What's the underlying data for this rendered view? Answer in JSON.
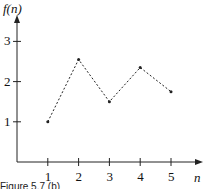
{
  "chart_data": {
    "type": "line",
    "title": "",
    "xlabel": "n",
    "ylabel": "f(n)",
    "x": [
      1,
      2,
      3,
      4,
      5
    ],
    "values": [
      1.0,
      2.55,
      1.5,
      2.35,
      1.75
    ],
    "x_ticks": [
      "1",
      "2",
      "3",
      "4",
      "5"
    ],
    "y_ticks": [
      "1",
      "2",
      "3"
    ],
    "line_style": "dashed",
    "markers": true,
    "grid": false,
    "xlim": [
      0,
      5.5
    ],
    "ylim": [
      0,
      3.5
    ]
  },
  "caption": "Figure 5.7 (b)"
}
